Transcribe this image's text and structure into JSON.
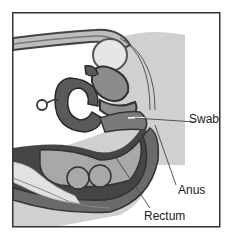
{
  "diagram": {
    "labels": [
      {
        "id": "swab",
        "text": "Swab"
      },
      {
        "id": "anus",
        "text": "Anus"
      },
      {
        "id": "rectum",
        "text": "Rectum"
      }
    ],
    "colors": {
      "background": "#ffffff",
      "shadow_tissue": "#cfcfcf",
      "dark_organ": "#5a5a5a",
      "mid_organ": "#8c8c8c",
      "light_organ": "#b4b4b4",
      "pale_organ": "#e2e2e2",
      "outline": "#333333"
    }
  }
}
